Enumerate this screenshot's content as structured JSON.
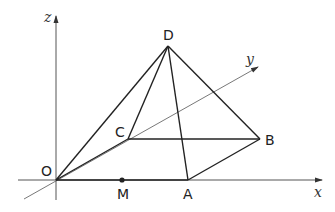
{
  "diagram": {
    "type": "3d-pyramid",
    "axes": {
      "x": {
        "label": "x"
      },
      "y": {
        "label": "y"
      },
      "z": {
        "label": "z"
      }
    },
    "points": {
      "O": {
        "label": "O"
      },
      "A": {
        "label": "A"
      },
      "B": {
        "label": "B"
      },
      "C": {
        "label": "C"
      },
      "D": {
        "label": "D"
      },
      "M": {
        "label": "M"
      }
    },
    "colors": {
      "edge": "#222222",
      "axis": "#555555"
    }
  }
}
